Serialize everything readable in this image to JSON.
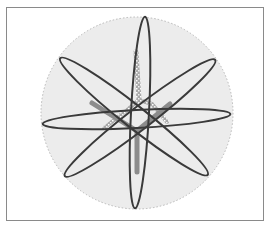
{
  "figure": {
    "colors": {
      "frame_border": "#8a8a8a",
      "disc_fill": "#ececec",
      "disc_edge": "#b8b8b8",
      "loop_stroke": "#3a3a3a",
      "trunk": "#8c8c8c",
      "texture": "#b0b0b0"
    },
    "disc": {
      "cx": 137,
      "cy": 113,
      "r": 96
    },
    "loops": [
      {
        "name": "loop-vertical",
        "cx": 140,
        "cy": 112.5,
        "rx": 96,
        "ry": 9,
        "angle": 93
      },
      {
        "name": "loop-diagonal-down",
        "cx": 134,
        "cy": 116.5,
        "rx": 94,
        "ry": 11,
        "angle": 38.3
      },
      {
        "name": "loop-diagonal-up",
        "cx": 140,
        "cy": 118,
        "rx": 95,
        "ry": 11,
        "angle": -37.7
      },
      {
        "name": "loop-horizontal",
        "cx": 136.5,
        "cy": 119,
        "rx": 94,
        "ry": 9,
        "angle": -3
      }
    ],
    "trunk": {
      "junction": [
        137,
        131
      ],
      "arms": [
        [
          92,
          103
        ],
        [
          170,
          104
        ],
        [
          137,
          172
        ]
      ]
    }
  }
}
